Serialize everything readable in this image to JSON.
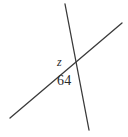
{
  "canvas": {
    "width": 128,
    "height": 137,
    "background_color": "#ffffff"
  },
  "diagram": {
    "kind": "two-intersecting-lines",
    "stroke_color": "#3a3a3a",
    "stroke_width": 1.3,
    "intersection_point": {
      "x": 72,
      "y": 68
    },
    "lines": [
      {
        "id": "steep-line",
        "name": "near-vertical-line",
        "x1": 65,
        "y1": 4,
        "x2": 89,
        "y2": 130
      },
      {
        "id": "shallow-line",
        "name": "rising-transversal-line",
        "x1": 10,
        "y1": 118,
        "x2": 122,
        "y2": 23
      }
    ]
  },
  "labels": {
    "unknown_angle": {
      "text": "z",
      "style": "italic",
      "position": {
        "x": 57,
        "y": 56
      },
      "font_size": 12,
      "color": "#2b2b2b"
    },
    "known_angle": {
      "text": "64",
      "style": "normal",
      "position": {
        "x": 57,
        "y": 74
      },
      "font_size": 14,
      "color": "#2b2b2b"
    }
  }
}
